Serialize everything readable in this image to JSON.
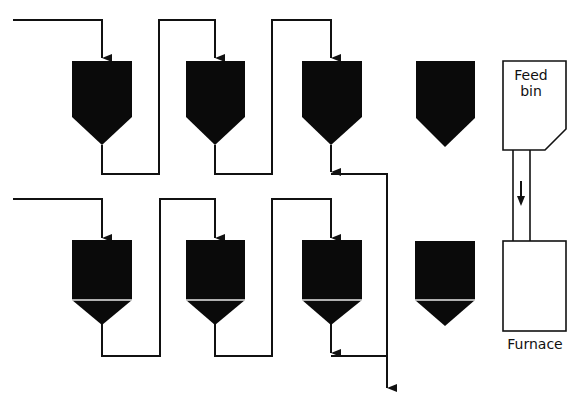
{
  "diagram": {
    "type": "process-flow",
    "colors": {
      "line": "#111111",
      "fill": "#0a0a0a",
      "background": "#ffffff"
    },
    "labels": {
      "feed_bin": "Feed\nbin",
      "feed_bin_line1": "Feed",
      "feed_bin_line2": "bin",
      "furnace": "Furnace"
    },
    "rows": [
      {
        "name": "top-row",
        "hoppers": 4,
        "connected": 3,
        "banded": false
      },
      {
        "name": "bottom-row",
        "hoppers": 4,
        "connected": 3,
        "banded": true
      }
    ],
    "arrows": [
      {
        "from": "feed-bin",
        "to": "furnace",
        "direction": "down"
      }
    ]
  }
}
